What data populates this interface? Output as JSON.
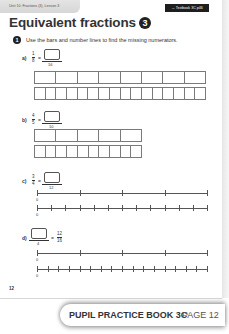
{
  "header": {
    "breadcrumb": "Unit 10: Fractions (3), Lesson 3",
    "textbook_link": "→ Textbook 3C p46"
  },
  "title": {
    "text": "Equivalent fractions",
    "lesson_number": "3"
  },
  "question": {
    "number": "1",
    "instruction": "Use the bars and number lines to find the missing numerators."
  },
  "parts": [
    {
      "label": "a)",
      "left_num": "1",
      "left_den": "8",
      "right_den": "16",
      "type": "bar",
      "top_segments": 8,
      "bottom_segments": 16
    },
    {
      "label": "b)",
      "left_num": "4",
      "left_den": "5",
      "right_den": "10",
      "type": "bar",
      "top_segments": 5,
      "bottom_segments": 10
    },
    {
      "label": "c)",
      "left_num": "3",
      "left_den": "4",
      "right_den": "12",
      "type": "number_line",
      "top_intervals": 4,
      "bottom_intervals": 12,
      "zero_label": "0"
    },
    {
      "label": "d)",
      "left_den": "4",
      "right_num": "12",
      "right_den": "16",
      "type": "number_line",
      "top_intervals": 4,
      "bottom_intervals": 16,
      "zero_label": "0"
    }
  ],
  "equals": "=",
  "page_number": "12",
  "footer": {
    "book": "PUPIL PRACTICE BOOK 3C",
    "page": "PAGE 12"
  }
}
